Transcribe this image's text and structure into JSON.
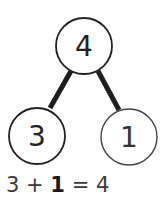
{
  "diagram": {
    "type": "number-bond",
    "whole": "4",
    "parts": [
      "3",
      "1"
    ],
    "equation": {
      "left": "3",
      "plus": "+",
      "missing": "1",
      "equals": "=",
      "result": "4"
    }
  }
}
